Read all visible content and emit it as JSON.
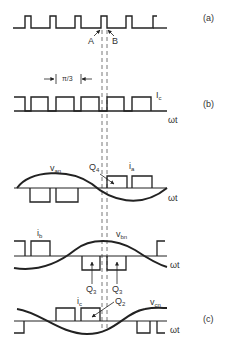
{
  "figure": {
    "panels": {
      "a": {
        "label": "(a)",
        "markers": {
          "A": "A",
          "B": "B"
        }
      },
      "b": {
        "label": "(b)",
        "current_label": "I",
        "current_sub": "c",
        "axis_label": "ωt",
        "interval_label": "π/3"
      },
      "phase_a": {
        "voltage_label": "v",
        "voltage_sub": "an",
        "current_label": "i",
        "current_sub": "a",
        "switch_label": "Q",
        "switch_sub": "4",
        "axis_label": "ωt"
      },
      "phase_b": {
        "voltage_label": "v",
        "voltage_sub": "bn",
        "current_label": "i",
        "current_sub": "b",
        "switch_label_1": "Q",
        "switch_sub_1": "3",
        "switch_label_2": "Q",
        "switch_sub_2": "3",
        "axis_label": "ωt"
      },
      "phase_c": {
        "label": "(c)",
        "voltage_label": "v",
        "voltage_sub": "cn",
        "current_label": "i",
        "current_sub": "c",
        "switch_label": "Q",
        "switch_sub": "2",
        "axis_label": "ωt"
      }
    },
    "colors": {
      "line": "#222222",
      "dashed": "#555555",
      "text": "#333333"
    }
  }
}
